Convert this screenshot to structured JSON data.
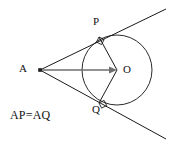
{
  "figure": {
    "type": "geometry-diagram",
    "background_color": "#ffffff",
    "stroke_color": "#1a1a1a",
    "axis_color": "#6e6e6e",
    "width": 172,
    "height": 147,
    "labels": {
      "external_point": "A",
      "center": "O",
      "tangent_point_upper": "P",
      "tangent_point_lower": "Q",
      "relation": "AP=AQ"
    },
    "points": {
      "A": {
        "x": 40,
        "y": 70
      },
      "O": {
        "x": 117,
        "y": 70
      },
      "P": {
        "x": 99,
        "y": 37
      },
      "Q": {
        "x": 99,
        "y": 103
      },
      "upper_line_end": {
        "x": 166,
        "y": 9
      },
      "lower_line_end": {
        "x": 166,
        "y": 139
      }
    },
    "circle": {
      "cx": 117,
      "cy": 70,
      "r": 35
    },
    "segments": [
      {
        "name": "tangent-line-upper",
        "from": "A",
        "to": "upper_line_end",
        "through": "P"
      },
      {
        "name": "tangent-line-lower",
        "from": "A",
        "to": "lower_line_end",
        "through": "Q"
      },
      {
        "name": "segment-AO",
        "from": "A",
        "to": "O",
        "arrow": "at-O"
      },
      {
        "name": "radius-OP",
        "from": "O",
        "to": "P"
      },
      {
        "name": "radius-OQ",
        "from": "O",
        "to": "Q"
      }
    ],
    "right_angle_markers": [
      {
        "name": "right-angle-at-P",
        "vertex": "P",
        "between": [
          "radius-OP",
          "tangent-line-upper"
        ]
      },
      {
        "name": "right-angle-at-Q",
        "vertex": "Q",
        "between": [
          "radius-OQ",
          "tangent-line-lower"
        ]
      }
    ]
  }
}
